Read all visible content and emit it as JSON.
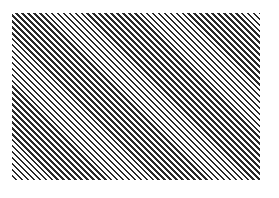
{
  "canvas": {
    "width": 279,
    "height": 198,
    "background": "#ffffff"
  },
  "pattern": {
    "type": "diagonal-stripes",
    "direction": "top-left-to-bottom-right",
    "stripe_color": "#2a2a2a",
    "gap_color": "#ffffff",
    "region": {
      "left": 12,
      "top": 13,
      "width": 248,
      "height": 167
    }
  }
}
